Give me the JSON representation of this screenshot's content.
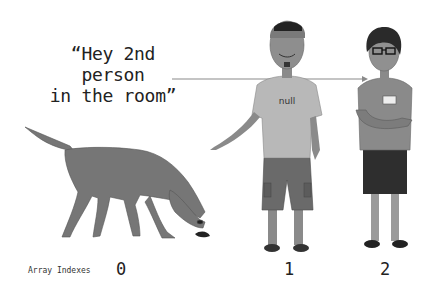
{
  "caption": {
    "line1": "“Hey 2nd person",
    "line2": "in the room”"
  },
  "axis_label": "Array Indexes",
  "indexes": [
    "0",
    "1",
    "2"
  ],
  "figures": [
    {
      "index": "0",
      "kind": "dog"
    },
    {
      "index": "1",
      "kind": "man",
      "shirt_text": "null"
    },
    {
      "index": "2",
      "kind": "woman",
      "badge_text": "HELLO"
    }
  ],
  "colors": {
    "figure_gray": "#7a7a7a",
    "dark": "#2a2a2a",
    "arrow": "#888888"
  }
}
